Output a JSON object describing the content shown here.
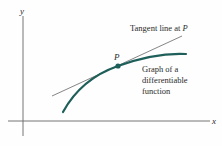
{
  "diagram": {
    "axes": {
      "x_label": "x",
      "y_label": "y",
      "color": "#555555"
    },
    "tangent": {
      "label": "Tangent line at ",
      "label_point": "P",
      "color": "#333333"
    },
    "point": {
      "label": "P",
      "color": "#1f5f5a"
    },
    "curve": {
      "label_lines": [
        "Graph of a",
        "differentiable",
        "function"
      ],
      "color": "#1f5f5a"
    }
  }
}
